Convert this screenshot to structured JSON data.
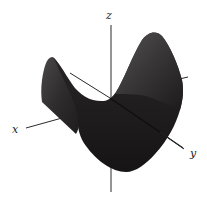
{
  "figure": {
    "axes": {
      "x_label": "x",
      "y_label": "y",
      "z_label": "z"
    },
    "colors": {
      "background": "#ffffff",
      "surface_dark": "#1e1c1c",
      "surface_mid": "#3a3838",
      "surface_light": "#5a5858",
      "axis": "#2a2a2a"
    }
  }
}
